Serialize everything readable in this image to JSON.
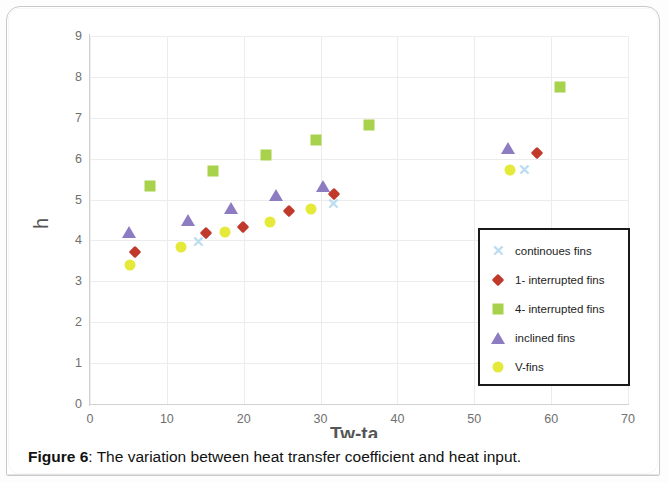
{
  "caption": {
    "prefix": "Figure 6",
    "text": ": The variation between heat transfer coefficient and heat input."
  },
  "chart_data": {
    "type": "scatter",
    "title": "",
    "xlabel": "Tw-ta",
    "ylabel": "h",
    "xlim": [
      0,
      70
    ],
    "ylim": [
      0,
      9
    ],
    "xticks": [
      "0",
      "10",
      "20",
      "30",
      "40",
      "50",
      "60",
      "70"
    ],
    "yticks": [
      "0",
      "1",
      "2",
      "3",
      "4",
      "5",
      "6",
      "7",
      "8",
      "9"
    ],
    "grid": true,
    "legend_position": "inside-right",
    "series": [
      {
        "name": "continoues fins",
        "marker": "x",
        "color": "#b9dcef",
        "points": [
          [
            14.1,
            3.95
          ],
          [
            31.6,
            4.88
          ],
          [
            56.5,
            5.72
          ]
        ]
      },
      {
        "name": "1- interrupted fins",
        "marker": "diamond",
        "color": "#c0392b",
        "points": [
          [
            5.9,
            3.72
          ],
          [
            15.1,
            4.18
          ],
          [
            19.9,
            4.33
          ],
          [
            25.9,
            4.72
          ],
          [
            31.7,
            5.13
          ],
          [
            58.1,
            6.15
          ]
        ]
      },
      {
        "name": "4- interrupted fins",
        "marker": "square",
        "color": "#a8d24b",
        "points": [
          [
            7.8,
            5.33
          ],
          [
            16.0,
            5.7
          ],
          [
            22.9,
            6.1
          ],
          [
            29.4,
            6.46
          ],
          [
            36.3,
            6.82
          ],
          [
            61.1,
            7.75
          ]
        ]
      },
      {
        "name": "inclined fins",
        "marker": "triangle",
        "color": "#8e7cc3",
        "points": [
          [
            5.1,
            4.2
          ],
          [
            12.7,
            4.5
          ],
          [
            18.4,
            4.8
          ],
          [
            24.2,
            5.12
          ],
          [
            30.3,
            5.32
          ],
          [
            54.4,
            6.25
          ]
        ]
      },
      {
        "name": "V-fins",
        "marker": "circle",
        "color": "#e5e93a",
        "points": [
          [
            5.2,
            3.4
          ],
          [
            11.9,
            3.85
          ],
          [
            17.6,
            4.2
          ],
          [
            23.4,
            4.44
          ],
          [
            28.8,
            4.77
          ],
          [
            54.6,
            5.73
          ]
        ]
      }
    ]
  }
}
